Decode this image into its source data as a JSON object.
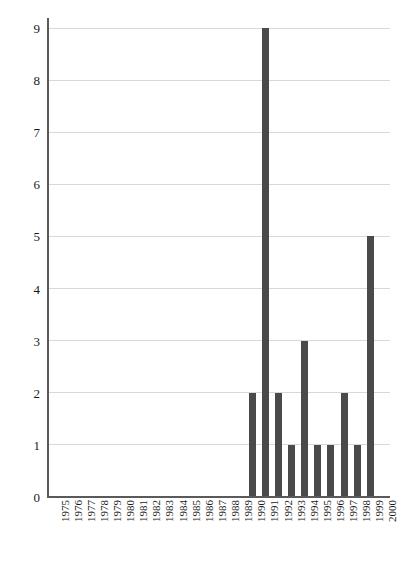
{
  "chart_data": {
    "type": "bar",
    "title": "",
    "subtitle": "",
    "xlabel": "",
    "ylabel": "",
    "categories": [
      "1975",
      "1976",
      "1977",
      "1978",
      "1979",
      "1980",
      "1981",
      "1982",
      "1983",
      "1984",
      "1985",
      "1986",
      "1987",
      "1988",
      "1989",
      "1990",
      "1991",
      "1992",
      "1993",
      "1994",
      "1995",
      "1996",
      "1997",
      "1998",
      "1999",
      "2000"
    ],
    "values": [
      0,
      0,
      0,
      0,
      0,
      0,
      0,
      0,
      0,
      0,
      0,
      0,
      0,
      0,
      0,
      2,
      9,
      2,
      1,
      3,
      1,
      1,
      2,
      1,
      5,
      0
    ],
    "ylim": [
      0,
      9
    ],
    "yticks": [
      0,
      1,
      2,
      3,
      4,
      5,
      6,
      7,
      8,
      9
    ],
    "ytick_labels": [
      "0",
      "1",
      "2",
      "3",
      "4",
      "5",
      "6",
      "7",
      "8",
      "9"
    ],
    "grid": true,
    "grid_axis": "y",
    "legend": null,
    "legend_position": "none",
    "bar_color": "#4a4a4a",
    "grid_color": "#d8d8d8",
    "axis_color": "#5a5a5a",
    "background_color": "#ffffff",
    "xtick_rotation": 90
  }
}
